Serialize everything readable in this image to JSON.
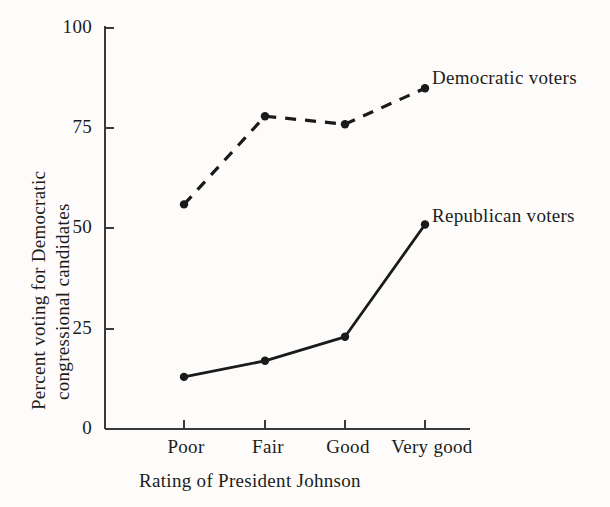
{
  "chart_data": {
    "type": "line",
    "title": "",
    "xlabel": "Rating of President Johnson",
    "ylabel": "Percent voting for Democratic congressional candidates",
    "ylabel_lines": [
      "Percent voting for Democratic",
      "congressional candidates"
    ],
    "categories": [
      "Poor",
      "Fair",
      "Good",
      "Very good"
    ],
    "series": [
      {
        "name": "Democratic voters",
        "values": [
          56,
          78,
          76,
          85
        ],
        "style": "dashed",
        "marker": "filled-circle",
        "color": "#1a1a1a"
      },
      {
        "name": "Republican voters",
        "values": [
          13,
          17,
          23,
          51
        ],
        "style": "solid",
        "marker": "filled-circle",
        "color": "#1a1a1a"
      }
    ],
    "ylim": [
      0,
      100
    ],
    "yticks": [
      0,
      25,
      50,
      75,
      100
    ],
    "ytick_labels": [
      "0",
      "25",
      "50",
      "75",
      "100"
    ],
    "grid": false,
    "legend_position": "inline-right-of-series"
  },
  "axes": {
    "y_tick_labels": [
      "100",
      "75",
      "50",
      "25",
      "0"
    ],
    "x_tick_labels": [
      "Poor",
      "Fair",
      "Good",
      "Very good"
    ],
    "x_title": "Rating of President Johnson",
    "y_title_line_1": "Percent voting for Democratic",
    "y_title_line_2": "congressional candidates"
  },
  "labels": {
    "democratic": "Democratic voters",
    "republican": "Republican voters"
  },
  "colors": {
    "ink": "#1a1a1a",
    "paper": "#fdfcfa",
    "axis": "#3a3a3a"
  }
}
